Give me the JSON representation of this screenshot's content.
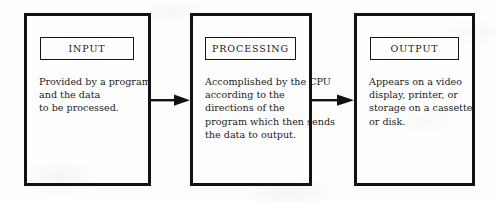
{
  "diagram": {
    "background_color": "#fdfdfb",
    "line_color": "#121212",
    "stages": [
      {
        "id": "input",
        "label": "INPUT",
        "body_lines": [
          "Provided by a program",
          "and the data",
          "to be processed."
        ]
      },
      {
        "id": "processing",
        "label": "PROCESSING",
        "body_lines": [
          "Accomplished by the CPU",
          "according to the",
          "directions of the",
          "program which then sends",
          "the data to output."
        ]
      },
      {
        "id": "output",
        "label": "OUTPUT",
        "body_lines": [
          "Appears on a video",
          "display, printer, or",
          "storage on a cassette",
          "or disk."
        ]
      }
    ],
    "connectors": [
      {
        "id": "input-to-processing",
        "icon": "right-arrow-icon"
      },
      {
        "id": "processing-to-output",
        "icon": "right-arrow-icon"
      }
    ]
  }
}
